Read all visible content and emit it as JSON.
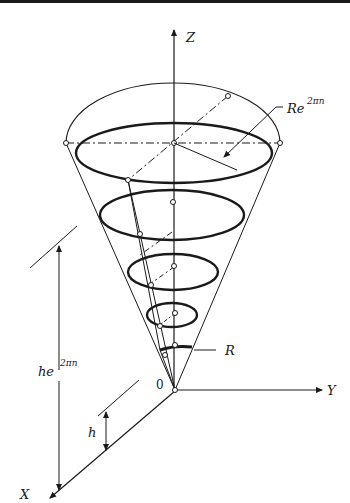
{
  "diagram": {
    "labels": {
      "z_axis": "Z",
      "y_axis": "Y",
      "x_axis": "X",
      "origin": "0",
      "top_radius_base": "Re",
      "top_radius_exp": "2πn",
      "base_radius": "R",
      "height_total_base": "he",
      "height_total_exp": "2πn",
      "height_step": "h"
    },
    "colors": {
      "ink": "#1a1a1a",
      "background": "#ffffff"
    }
  }
}
